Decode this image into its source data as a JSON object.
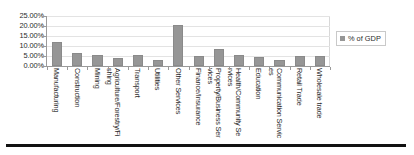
{
  "chart_data": {
    "type": "bar",
    "title": "",
    "xlabel": "",
    "ylabel": "",
    "ylim": [
      0,
      25
    ],
    "grid": true,
    "legend_position": "right",
    "units": "percent",
    "categories": [
      "Manufacturing",
      "Construction",
      "Mining",
      "Agriculture/Forestry/Fishing",
      "Transport",
      "Utilities",
      "Other Services",
      "Finance/Insurance",
      "Property/Business Services",
      "Health/Community Services",
      "Education",
      "Communication Services",
      "Retail Trade",
      "Wholesale trade"
    ],
    "series": [
      {
        "name": "% of GDP",
        "values": [
          11.8,
          6.3,
          5.5,
          3.8,
          5.5,
          2.8,
          20.6,
          5.1,
          8.3,
          5.7,
          4.5,
          3.0,
          5.2,
          5.2
        ]
      }
    ],
    "ytick_labels": [
      "25.00%",
      "20.00%",
      "15.00%",
      "10.00%",
      "5.00%",
      "0.00%"
    ],
    "ytick_values": [
      25,
      20,
      15,
      10,
      5,
      0
    ],
    "colors": {
      "bar": "#969696",
      "bar_border": "#8a8a8a",
      "axis": "#9a9a9a",
      "gridline": "#e3e3e3",
      "text": "#2b2b2b",
      "rule": "#111111"
    }
  },
  "legend": {
    "entries": [
      {
        "label": "% of GDP",
        "swatch_name": "legend-swatch-pct-of-gdp"
      }
    ]
  }
}
